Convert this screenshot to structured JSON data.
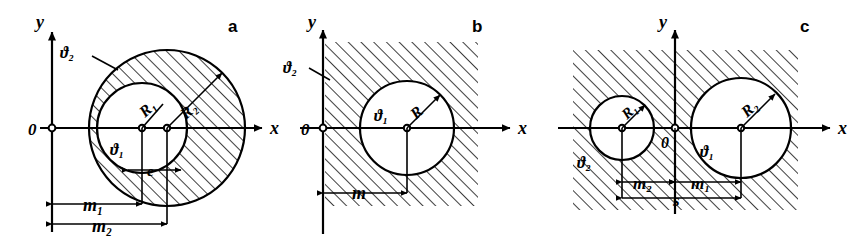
{
  "figure": {
    "title": "",
    "background_color": "#ffffff",
    "ink_color": "#000000",
    "panels": [
      {
        "id": "a",
        "letter": "a",
        "axis_y_label": "y",
        "axis_x_label": "x",
        "origin_label": "0",
        "region_outer_label": "ϑ₂",
        "region_inner_label": "ϑ₁",
        "radius_inner_label": "R₁",
        "radius_outer_label": "R₂",
        "eccentricity_label": "e",
        "dim_inner_label": "m₁",
        "dim_outer_label": "m₂",
        "description": "Eccentric circular annulus: outer circle R2 hatched region, inner circle R1 unhatched"
      },
      {
        "id": "b",
        "letter": "b",
        "axis_y_label": "y",
        "axis_x_label": "x",
        "origin_label": "0",
        "region_outer_label": "ϑ₂",
        "region_inner_label": "ϑ₁",
        "radius_label": "R",
        "dim_label": "m",
        "description": "Single circle of radius R, exterior half-plane hatched"
      },
      {
        "id": "c",
        "letter": "c",
        "axis_y_label": "y",
        "axis_x_label": "x",
        "origin_label": "0",
        "region_outer_label": "ϑ₂",
        "region_inner_label": "ϑ₁",
        "radius_left_label": "R₁",
        "radius_right_label": "R₂",
        "dim_left_label": "m₂",
        "dim_right_label": "m₁",
        "dim_span_label": "s",
        "description": "Two separated circles R1 and R2, surrounding region hatched, centre distance s"
      }
    ]
  }
}
